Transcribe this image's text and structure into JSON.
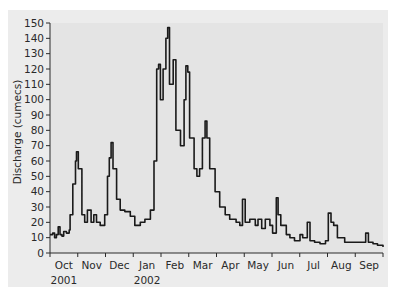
{
  "chart_data": {
    "type": "line",
    "title": "",
    "xlabel": "",
    "ylabel": "Discharge (cumecs)",
    "ylim": [
      0,
      150
    ],
    "yticks": [
      0,
      10,
      20,
      30,
      40,
      50,
      60,
      70,
      80,
      90,
      100,
      110,
      120,
      130,
      140,
      150
    ],
    "xlim_days": [
      0,
      365
    ],
    "month_labels": [
      "Oct",
      "Nov",
      "Dec",
      "Jan",
      "Feb",
      "Mar",
      "Apr",
      "May",
      "Jun",
      "Jul",
      "Aug",
      "Sep"
    ],
    "year_labels": [
      {
        "label": "2001",
        "month_index": 0
      },
      {
        "label": "2002",
        "month_index": 3
      }
    ],
    "grid": false,
    "legend": null,
    "line_color": "#1a1a1a",
    "series": [
      {
        "name": "Discharge",
        "points": [
          [
            0,
            12
          ],
          [
            3,
            13
          ],
          [
            5,
            10
          ],
          [
            7,
            12
          ],
          [
            9,
            17
          ],
          [
            11,
            12
          ],
          [
            13,
            11
          ],
          [
            15,
            14
          ],
          [
            18,
            13
          ],
          [
            21,
            15
          ],
          [
            22,
            25
          ],
          [
            25,
            45
          ],
          [
            28,
            60
          ],
          [
            29,
            66
          ],
          [
            31,
            55
          ],
          [
            35,
            25
          ],
          [
            38,
            20
          ],
          [
            41,
            28
          ],
          [
            45,
            20
          ],
          [
            48,
            25
          ],
          [
            51,
            20
          ],
          [
            55,
            18
          ],
          [
            60,
            25
          ],
          [
            63,
            50
          ],
          [
            65,
            62
          ],
          [
            67,
            72
          ],
          [
            69,
            55
          ],
          [
            73,
            35
          ],
          [
            77,
            28
          ],
          [
            82,
            27
          ],
          [
            88,
            24
          ],
          [
            93,
            18
          ],
          [
            99,
            20
          ],
          [
            104,
            22
          ],
          [
            110,
            28
          ],
          [
            114,
            60
          ],
          [
            117,
            120
          ],
          [
            119,
            123
          ],
          [
            121,
            100
          ],
          [
            124,
            120
          ],
          [
            127,
            140
          ],
          [
            129,
            147
          ],
          [
            131,
            110
          ],
          [
            135,
            126
          ],
          [
            138,
            80
          ],
          [
            143,
            70
          ],
          [
            147,
            100
          ],
          [
            149,
            122
          ],
          [
            151,
            118
          ],
          [
            153,
            75
          ],
          [
            158,
            55
          ],
          [
            161,
            50
          ],
          [
            164,
            55
          ],
          [
            167,
            75
          ],
          [
            170,
            86
          ],
          [
            172,
            75
          ],
          [
            175,
            55
          ],
          [
            181,
            40
          ],
          [
            186,
            30
          ],
          [
            192,
            25
          ],
          [
            197,
            22
          ],
          [
            204,
            20
          ],
          [
            208,
            18
          ],
          [
            211,
            35
          ],
          [
            214,
            20
          ],
          [
            219,
            22
          ],
          [
            225,
            18
          ],
          [
            228,
            22
          ],
          [
            232,
            16
          ],
          [
            236,
            22
          ],
          [
            241,
            18
          ],
          [
            244,
            13
          ],
          [
            248,
            36
          ],
          [
            250,
            25
          ],
          [
            253,
            18
          ],
          [
            259,
            12
          ],
          [
            263,
            10
          ],
          [
            268,
            8
          ],
          [
            274,
            12
          ],
          [
            277,
            10
          ],
          [
            282,
            20
          ],
          [
            285,
            8
          ],
          [
            290,
            7
          ],
          [
            296,
            6
          ],
          [
            302,
            8
          ],
          [
            305,
            26
          ],
          [
            308,
            20
          ],
          [
            311,
            18
          ],
          [
            315,
            10
          ],
          [
            323,
            7
          ],
          [
            334,
            7
          ],
          [
            342,
            7
          ],
          [
            346,
            13
          ],
          [
            349,
            7
          ],
          [
            354,
            6
          ],
          [
            359,
            5
          ],
          [
            365,
            4
          ]
        ]
      }
    ]
  },
  "axis": {
    "ylabel": "Discharge (cumecs)"
  }
}
